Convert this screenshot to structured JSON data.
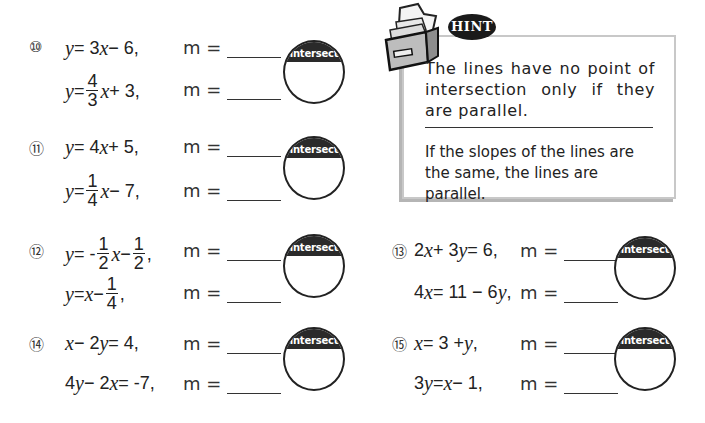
{
  "hint": {
    "badge": "HINT",
    "text1": "The lines have no point of intersection only if they are parallel.",
    "text2": "If the slopes of the lines are the same, the lines are parallel."
  },
  "circle_label": "intersect",
  "m_label": "m =",
  "problems": [
    {
      "number": "⑩",
      "eq1": {
        "parts": [
          "y",
          " = 3",
          "x",
          " − 6,"
        ]
      },
      "eq2": {
        "pre": "y",
        "mid": " = ",
        "frac_num": "4",
        "frac_den": "3",
        "post_var": "x",
        "post": " + 3,"
      }
    },
    {
      "number": "⑪",
      "eq1": {
        "parts": [
          "y",
          " = 4",
          "x",
          " + 5,"
        ]
      },
      "eq2": {
        "pre": "y",
        "mid": " = ",
        "frac_num": "1",
        "frac_den": "4",
        "post_var": "x",
        "post": " − 7,"
      }
    },
    {
      "number": "⑫",
      "eq1": {
        "pre": "y",
        "mid": " = - ",
        "frac_num": "1",
        "frac_den": "2",
        "post_var": "x",
        "post": " − ",
        "frac2_num": "1",
        "frac2_den": "2",
        "tail": ","
      },
      "eq2": {
        "pre": "y",
        "mid": " = ",
        "var": "x",
        "post": " − ",
        "frac_num": "1",
        "frac_den": "4",
        "tail": ","
      }
    },
    {
      "number": "⑬",
      "eq1": {
        "parts": [
          "2",
          "x",
          " + 3",
          "y",
          " = 6,"
        ]
      },
      "eq2": {
        "parts": [
          "4",
          "x",
          " = 11 − 6",
          "y",
          ","
        ]
      }
    },
    {
      "number": "⑭",
      "eq1": {
        "parts": [
          "x",
          " − 2",
          "y",
          " = 4,"
        ]
      },
      "eq2": {
        "parts": [
          "4",
          "y",
          " − 2",
          "x",
          " = -7,"
        ]
      }
    },
    {
      "number": "⑮",
      "eq1": {
        "parts": [
          "x",
          " = 3 + ",
          "y",
          ","
        ]
      },
      "eq2": {
        "parts": [
          "3",
          "y",
          " = ",
          "x",
          " − 1,"
        ]
      }
    }
  ]
}
